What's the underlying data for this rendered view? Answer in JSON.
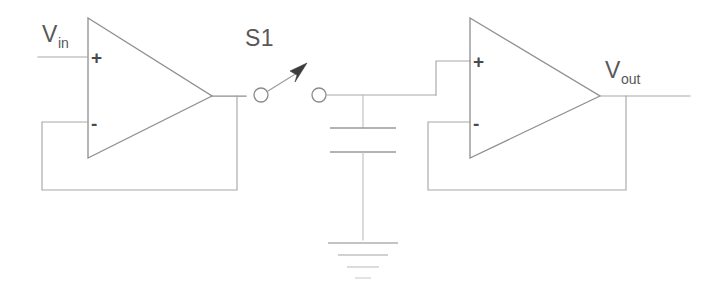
{
  "diagram": {
    "width": 719,
    "height": 301,
    "background_color": "#ffffff",
    "line_color": "#8e8e8e",
    "arrow_color": "#3c3c3c"
  },
  "labels": {
    "vin_main": "V",
    "vin_sub": "in",
    "vout_main": "V",
    "vout_sub": "out",
    "switch": "S1"
  },
  "input_buffer": {
    "name": "input-buffer-opamp",
    "plus_sign": "+",
    "minus_sign": "-",
    "config": "unity-gain buffer"
  },
  "output_buffer": {
    "name": "output-buffer-opamp",
    "plus_sign": "+",
    "minus_sign": "-",
    "config": "unity-gain buffer"
  },
  "switch": {
    "name": "sample-switch-s1",
    "label": "S1",
    "state": "open"
  },
  "capacitor": {
    "name": "hold-capacitor",
    "plates": 2
  },
  "ground": {
    "name": "ground-symbol",
    "bars": 4
  },
  "nets": {
    "input_net": "Vin",
    "sample_node": "sampled input",
    "hold_node": "held voltage",
    "output_net": "Vout"
  }
}
